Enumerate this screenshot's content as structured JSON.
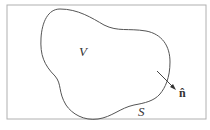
{
  "diagram": {
    "region_label": "V",
    "surface_label": "S",
    "normal_label": "n̂",
    "colors": {
      "frame": "#b0b0b0",
      "curve": "#555555",
      "text": "#333333",
      "background": "#ffffff"
    }
  }
}
